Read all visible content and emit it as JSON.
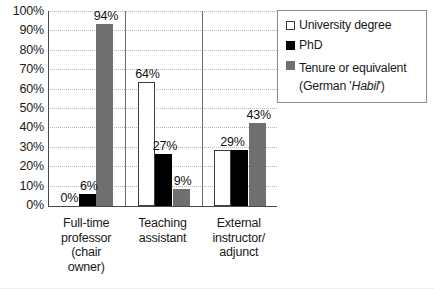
{
  "chart_data": {
    "type": "bar",
    "title": "",
    "xlabel": "",
    "ylabel": "",
    "ylim": [
      0,
      100
    ],
    "grid": true,
    "legend_position": "top-right",
    "categories": [
      "Full-time professor (chair owner)",
      "Teaching assistant",
      "External instructor/ adjunct"
    ],
    "category_lines": [
      [
        "Full-time",
        "professor",
        "(chair",
        "owner)"
      ],
      [
        "Teaching",
        "assistant"
      ],
      [
        "External",
        "instructor/",
        "adjunct"
      ]
    ],
    "series": [
      {
        "name": "University degree",
        "color": "#ffffff",
        "values": [
          0,
          64,
          29
        ]
      },
      {
        "name": "PhD",
        "color": "#000000",
        "values": [
          6,
          27,
          29
        ]
      },
      {
        "name": "Tenure or equivalent (German 'Habil')",
        "color": "#707070",
        "values": [
          94,
          9,
          43
        ]
      }
    ],
    "yticks": [
      "100%",
      "90%",
      "80%",
      "70%",
      "60%",
      "50%",
      "40%",
      "30%",
      "20%",
      "10%",
      "0%"
    ],
    "ytick_values": [
      100,
      90,
      80,
      70,
      60,
      50,
      40,
      30,
      20,
      10,
      0
    ],
    "data_labels": [
      {
        "text": "0%",
        "group": 0,
        "series": 0
      },
      {
        "text": "6%",
        "group": 0,
        "series": 1
      },
      {
        "text": "94%",
        "group": 0,
        "series": 2
      },
      {
        "text": "64%",
        "group": 1,
        "series": 0
      },
      {
        "text": "27%",
        "group": 1,
        "series": 1
      },
      {
        "text": "9%",
        "group": 1,
        "series": 2
      },
      {
        "text": "29%",
        "group": 2,
        "series": 0
      },
      {
        "text": "43%",
        "group": 2,
        "series": 2
      }
    ]
  },
  "legend": {
    "items": [
      {
        "label": "University degree",
        "sub": "",
        "swatch": "white"
      },
      {
        "label": "PhD",
        "sub": "",
        "swatch": "black"
      },
      {
        "label": "Tenure or equivalent",
        "sub_prefix": "(German '",
        "sub_italic": "Habil",
        "sub_suffix": "')",
        "swatch": "gray"
      }
    ]
  }
}
